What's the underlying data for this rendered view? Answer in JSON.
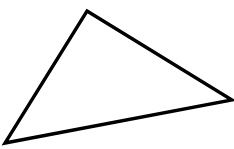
{
  "canvas": {
    "width": 234,
    "height": 149,
    "background_color": "#ffffff",
    "description": "line-drawing of a single scalene triangle outline"
  },
  "figure": {
    "name": "triangle",
    "shape_type": "triangle",
    "fill_color": "none",
    "stroke_color": "#000000",
    "stroke_width": 3.4,
    "stroke_linejoin": "miter",
    "stroke_linecap": "butt",
    "points_attr": "87,11 232,100 5,143",
    "vertices": [
      {
        "label": "apex-top",
        "x": 87,
        "y": 11
      },
      {
        "label": "right",
        "x": 232,
        "y": 100
      },
      {
        "label": "bottom-left",
        "x": 5,
        "y": 143
      }
    ],
    "edges": [
      {
        "label": "top-right-edge",
        "from": "apex-top",
        "to": "right"
      },
      {
        "label": "bottom-edge",
        "from": "right",
        "to": "bottom-left"
      },
      {
        "label": "left-edge",
        "from": "bottom-left",
        "to": "apex-top"
      }
    ]
  }
}
